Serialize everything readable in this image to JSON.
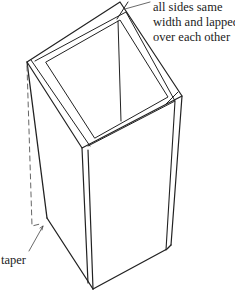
{
  "diagram": {
    "line_color": "#222222",
    "background": "#ffffff",
    "annotations": {
      "sides": {
        "lines": [
          "all sides same",
          "width and lapped",
          "over each other"
        ]
      },
      "taper": {
        "text": "taper"
      }
    }
  }
}
